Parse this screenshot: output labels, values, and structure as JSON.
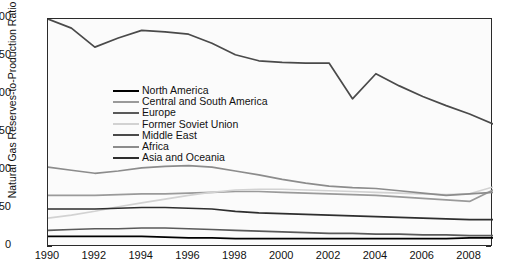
{
  "chart_data": {
    "type": "line",
    "title": "",
    "xlabel": "",
    "ylabel": "Natural Gas Reserves-to-Production Ratio",
    "xlim": [
      1990,
      2009
    ],
    "ylim": [
      0,
      300
    ],
    "yticks": [
      0,
      50,
      100,
      150,
      200,
      250,
      300
    ],
    "xticks": [
      1990,
      1992,
      1994,
      1996,
      1998,
      2000,
      2002,
      2004,
      2006,
      2008
    ],
    "grid": false,
    "legend_position": "upper-left-inside",
    "x": [
      1990,
      1991,
      1992,
      1993,
      1994,
      1995,
      1996,
      1997,
      1998,
      1999,
      2000,
      2001,
      2002,
      2003,
      2004,
      2005,
      2006,
      2007,
      2008,
      2009
    ],
    "series": [
      {
        "name": "North America",
        "color": "#000000",
        "values": [
          14,
          14,
          14,
          14,
          14,
          13,
          12,
          12,
          11,
          11,
          11,
          11,
          11,
          11,
          11,
          11,
          11,
          11,
          12,
          12
        ]
      },
      {
        "name": "Central and South America",
        "color": "#9a9a9a",
        "values": [
          68,
          68,
          68,
          69,
          70,
          70,
          71,
          72,
          73,
          73,
          72,
          71,
          70,
          69,
          68,
          66,
          64,
          62,
          60,
          75
        ]
      },
      {
        "name": "Europe",
        "color": "#5a5a5a",
        "values": [
          22,
          23,
          24,
          24,
          25,
          25,
          24,
          23,
          22,
          21,
          20,
          19,
          18,
          18,
          17,
          17,
          16,
          16,
          15,
          15
        ]
      },
      {
        "name": "Former Soviet Union",
        "color": "#d2d2d2",
        "values": [
          38,
          42,
          47,
          53,
          58,
          63,
          68,
          72,
          75,
          76,
          76,
          75,
          74,
          73,
          72,
          71,
          70,
          69,
          70,
          79
        ]
      },
      {
        "name": "Middle East",
        "color": "#4a4a4a",
        "values": [
          300,
          288,
          263,
          275,
          285,
          283,
          280,
          268,
          253,
          245,
          243,
          242,
          242,
          195,
          228,
          212,
          198,
          186,
          175,
          162
        ]
      },
      {
        "name": "Africa",
        "color": "#8c8c8c",
        "values": [
          105,
          101,
          97,
          100,
          104,
          106,
          107,
          105,
          100,
          95,
          89,
          84,
          80,
          78,
          77,
          74,
          71,
          68,
          70,
          72
        ]
      },
      {
        "name": "Asia and Oceania",
        "color": "#2e2e2e",
        "values": [
          50,
          50,
          50,
          51,
          52,
          52,
          51,
          50,
          47,
          45,
          44,
          43,
          42,
          41,
          40,
          39,
          38,
          37,
          36,
          36
        ]
      }
    ]
  },
  "axes": {
    "ylabel": "Natural Gas Reserves-to-Production Ratio",
    "ytick_labels": [
      "0",
      "50",
      "100",
      "150",
      "200",
      "250",
      "300"
    ],
    "xtick_labels": [
      "1990",
      "1992",
      "1994",
      "1996",
      "1998",
      "2000",
      "2002",
      "2004",
      "2006",
      "2008"
    ]
  }
}
